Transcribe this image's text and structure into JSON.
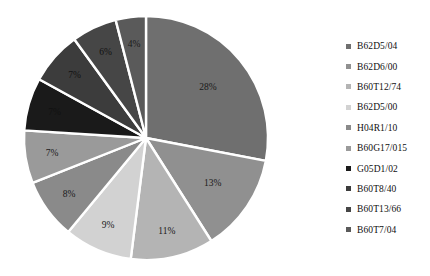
{
  "chart_data": {
    "type": "pie",
    "title": "",
    "xlabel": "",
    "ylabel": "",
    "legend_position": "right",
    "grid": false,
    "start_angle_deg": 0,
    "direction": "clockwise",
    "separator_color": "#ffffff",
    "categories": [
      "B62D5/04",
      "B62D6/00",
      "B60T12/74",
      "B62D5/00",
      "H04R1/10",
      "B60G17/015",
      "G05D1/02",
      "B60T8/40",
      "B60T13/66",
      "B60T7/04"
    ],
    "values": [
      28,
      13,
      11,
      9,
      8,
      7,
      7,
      7,
      6,
      4
    ],
    "labels": [
      "28%",
      "13%",
      "11%",
      "9%",
      "8%",
      "7%",
      "7%",
      "7%",
      "6%",
      "4%"
    ],
    "colors": [
      "#6f6f6f",
      "#909090",
      "#b4b4b4",
      "#d2d2d2",
      "#8a8a8a",
      "#9a9a9a",
      "#1a1a1a",
      "#3c3c3c",
      "#464646",
      "#5a5a5a"
    ]
  },
  "legend": {
    "items": [
      {
        "label": "B62D5/04",
        "color": "#6f6f6f"
      },
      {
        "label": "B62D6/00",
        "color": "#909090"
      },
      {
        "label": "B60T12/74",
        "color": "#b4b4b4"
      },
      {
        "label": "B62D5/00",
        "color": "#d2d2d2"
      },
      {
        "label": "H04R1/10",
        "color": "#8a8a8a"
      },
      {
        "label": "B60G17/015",
        "color": "#9a9a9a"
      },
      {
        "label": "G05D1/02",
        "color": "#1a1a1a"
      },
      {
        "label": "B60T8/40",
        "color": "#3c3c3c"
      },
      {
        "label": "B60T13/66",
        "color": "#464646"
      },
      {
        "label": "B60T7/04",
        "color": "#5a5a5a"
      }
    ]
  }
}
